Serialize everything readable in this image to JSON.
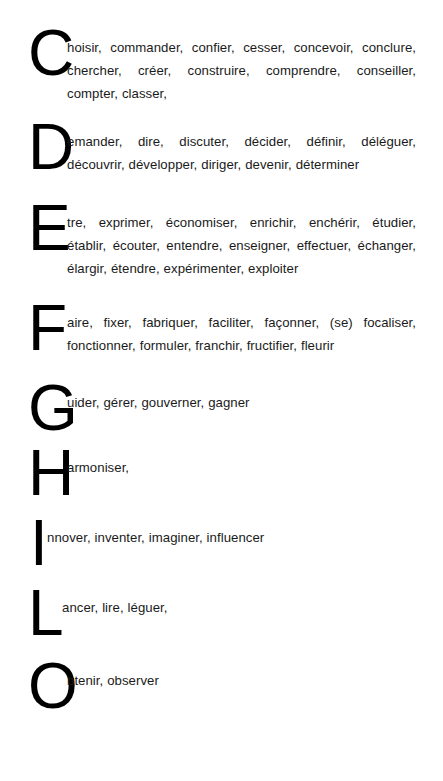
{
  "document": {
    "background_color": "#ffffff",
    "text_color": "#000000",
    "title": "Liste de verbes classés par lettre initiale"
  },
  "entries": [
    {
      "letter": "C",
      "verbs_text": "hoisir, commander, confier, cesser, concevoir, conclure, chercher, créer, construire, comprendre, conseiller, compter, classer,",
      "verbs": [
        "choisir",
        "commander",
        "confier",
        "cesser",
        "concevoir",
        "conclure",
        "chercher",
        "créer",
        "construire",
        "comprendre",
        "conseiller",
        "compter",
        "classer"
      ],
      "line_count": 3
    },
    {
      "letter": "D",
      "verbs_text": "emander, dire, discuter, décider, définir, déléguer, découvrir, développer, diriger, devenir, déterminer",
      "verbs": [
        "demander",
        "dire",
        "discuter",
        "décider",
        "définir",
        "déléguer",
        "découvrir",
        "développer",
        "diriger",
        "devenir",
        "déterminer"
      ],
      "line_count": 2
    },
    {
      "letter": "E",
      "verbs_text": "tre, exprimer, économiser, enrichir, enchérir, étudier, établir, écouter, entendre, enseigner, effectuer, échanger, élargir, étendre, expérimenter, exploiter",
      "verbs": [
        "être",
        "exprimer",
        "économiser",
        "enrichir",
        "enchérir",
        "étudier",
        "établir",
        "écouter",
        "entendre",
        "enseigner",
        "effectuer",
        "échanger",
        "élargir",
        "étendre",
        "expérimenter",
        "exploiter"
      ],
      "line_count": 3
    },
    {
      "letter": "F",
      "verbs_text": "aire, fixer, fabriquer, faciliter, façonner, (se) focaliser, fonctionner, formuler, franchir, fructifier, fleurir",
      "verbs": [
        "faire",
        "fixer",
        "fabriquer",
        "faciliter",
        "façonner",
        "(se) focaliser",
        "fonctionner",
        "formuler",
        "franchir",
        "fructifier",
        "fleurir"
      ],
      "line_count": 2
    },
    {
      "letter": "G",
      "verbs_text": "uider, gérer, gouverner, gagner",
      "verbs": [
        "guider",
        "gérer",
        "gouverner",
        "gagner"
      ],
      "line_count": 1
    },
    {
      "letter": "H",
      "verbs_text": "armoniser,",
      "verbs": [
        "harmoniser"
      ],
      "line_count": 1
    },
    {
      "letter": "I",
      "verbs_text": "nnover, inventer, imaginer, influencer",
      "verbs": [
        "innover",
        "inventer",
        "imaginer",
        "influencer"
      ],
      "line_count": 1
    },
    {
      "letter": "L",
      "verbs_text": "ancer, lire, léguer,",
      "verbs": [
        "lancer",
        "lire",
        "léguer"
      ],
      "line_count": 1
    },
    {
      "letter": "O",
      "verbs_text": "btenir, observer",
      "verbs": [
        "obtenir",
        "observer"
      ],
      "line_count": 1
    }
  ]
}
